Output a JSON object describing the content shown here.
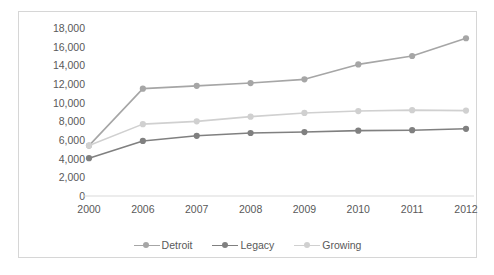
{
  "chart_data": {
    "type": "line",
    "title": "",
    "xlabel": "",
    "ylabel": "",
    "categories": [
      "2000",
      "2006",
      "2007",
      "2008",
      "2009",
      "2010",
      "2011",
      "2012"
    ],
    "series": [
      {
        "name": "Detroit",
        "color": "#a6a6a6",
        "values": [
          5400,
          11500,
          11800,
          12100,
          12500,
          14100,
          15000,
          16900
        ]
      },
      {
        "name": "Legacy",
        "color": "#808080",
        "values": [
          4050,
          5900,
          6450,
          6750,
          6850,
          7000,
          7050,
          7200
        ]
      },
      {
        "name": "Growing",
        "color": "#d0d0d0",
        "values": [
          5400,
          7700,
          8000,
          8500,
          8900,
          9100,
          9200,
          9150
        ]
      }
    ],
    "ylim": [
      0,
      18000
    ],
    "ytick_values": [
      0,
      2000,
      4000,
      6000,
      8000,
      10000,
      12000,
      14000,
      16000,
      18000
    ],
    "ytick_labels": [
      "0",
      "2,000",
      "4,000",
      "6,000",
      "8,000",
      "10,000",
      "12,000",
      "14,000",
      "16,000",
      "18,000"
    ],
    "grid": false,
    "legend_position": "bottom",
    "legend_entries": [
      "Detroit",
      "Legacy",
      "Growing"
    ],
    "axis_color": "#d9d9d9",
    "text_color": "#595959",
    "border_color": "#d6d6d6",
    "background": "#ffffff"
  }
}
